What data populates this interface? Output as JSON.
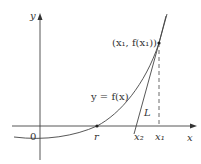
{
  "diagram": {
    "axes": {
      "x_label": "x",
      "y_label": "y",
      "origin_label": "0"
    },
    "curve": {
      "label": "y = f(x)"
    },
    "tangent_line": {
      "label": "L"
    },
    "points": {
      "tangent_point": "(x₁, f(x₁))",
      "root": "r",
      "x1": "x₁",
      "x2": "x₂"
    },
    "colors": {
      "stroke": "#444444",
      "background": "#ffffff"
    }
  }
}
